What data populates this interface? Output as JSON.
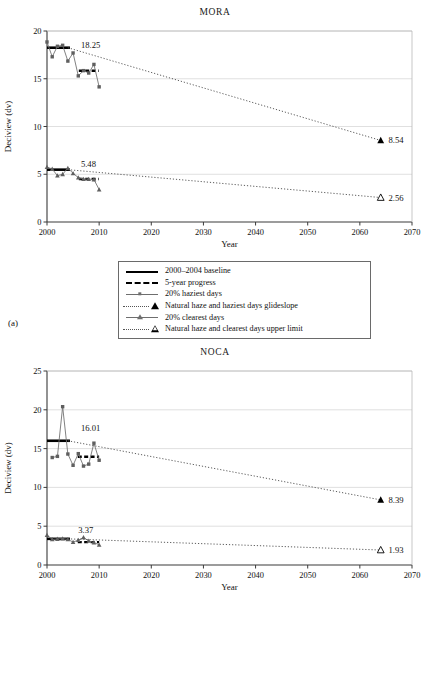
{
  "figure": {
    "axis_label_y": "Deciview (dv)",
    "axis_label_x": "Year",
    "panel_a_label": "(a)",
    "panel_b_label": "(b)"
  },
  "legend": {
    "items": [
      {
        "key": "solid-line",
        "label": "2000–2004 baseline"
      },
      {
        "key": "dashed-line",
        "label": "5-year progress"
      },
      {
        "key": "square-marker-line",
        "label": "20% haziest days"
      },
      {
        "key": "dotted-filled-triangle",
        "label": "Natural haze and haziest days glideslope"
      },
      {
        "key": "triangle-marker-line",
        "label": "20% clearest days"
      },
      {
        "key": "dotted-open-triangle",
        "label": "Natural haze and clearest days upper limit"
      }
    ]
  },
  "chart_data": [
    {
      "type": "line",
      "title": "MORA",
      "panel": "(a)",
      "xlabel": "Year",
      "ylabel": "Deciview (dv)",
      "xlim": [
        2000,
        2070
      ],
      "ylim": [
        0,
        20
      ],
      "xticks": [
        2000,
        2010,
        2020,
        2030,
        2040,
        2050,
        2060,
        2070
      ],
      "yticks": [
        0,
        5,
        10,
        15,
        20
      ],
      "grid": "horizontal",
      "legend_position": "below-plot",
      "annotations": [
        {
          "text": "18.25",
          "x": 2006.5,
          "y": 18.5
        },
        {
          "text": "5.48",
          "x": 2006.5,
          "y": 6.1
        },
        {
          "text": "8.54",
          "x": 2065.5,
          "y": 8.54
        },
        {
          "text": "2.56",
          "x": 2065.5,
          "y": 2.56
        }
      ],
      "series": [
        {
          "name": "2000-2004 baseline (haziest)",
          "style": "solid-bar",
          "value": 18.25,
          "x_start": 2000,
          "x_end": 2004.4
        },
        {
          "name": "5-year progress (haziest)",
          "style": "dashed-bar",
          "value": 15.83,
          "x_start": 2006.1,
          "x_end": 2009.9
        },
        {
          "name": "20% haziest days",
          "style": "line-square",
          "x": [
            2000,
            2001,
            2002,
            2003,
            2004,
            2005,
            2006,
            2007,
            2008,
            2009,
            2010
          ],
          "values": [
            18.85,
            17.3,
            18.4,
            18.5,
            16.85,
            17.7,
            15.3,
            15.85,
            15.6,
            16.5,
            14.15
          ]
        },
        {
          "name": "Natural haze and haziest days glideslope",
          "style": "dotted",
          "x": [
            2004,
            2064
          ],
          "values": [
            18.25,
            8.54
          ],
          "end_marker": "filled-triangle",
          "end_value": 8.54
        },
        {
          "name": "2000-2004 baseline (clearest)",
          "style": "solid-bar",
          "value": 5.48,
          "x_start": 2000,
          "x_end": 2004.4
        },
        {
          "name": "5-year progress (clearest)",
          "style": "dashed-bar",
          "value": 4.5,
          "x_start": 2006.1,
          "x_end": 2009.9
        },
        {
          "name": "20% clearest days",
          "style": "line-triangle",
          "x": [
            2000,
            2001,
            2002,
            2003,
            2004,
            2005,
            2006,
            2007,
            2008,
            2009,
            2010
          ],
          "values": [
            5.75,
            5.55,
            4.85,
            5.0,
            5.65,
            5.1,
            4.65,
            4.5,
            4.5,
            4.45,
            3.4
          ]
        },
        {
          "name": "Natural haze and clearest days upper limit",
          "style": "dotted",
          "x": [
            2004,
            2064
          ],
          "values": [
            5.48,
            2.56
          ],
          "end_marker": "open-triangle",
          "end_value": 2.56
        }
      ]
    },
    {
      "type": "line",
      "title": "NOCA",
      "panel": "(b)",
      "xlabel": "Year",
      "ylabel": "Deciview (dv)",
      "xlim": [
        2000,
        2070
      ],
      "ylim": [
        0,
        25
      ],
      "xticks": [
        2000,
        2010,
        2020,
        2030,
        2040,
        2050,
        2060,
        2070
      ],
      "yticks": [
        0,
        5,
        10,
        15,
        20,
        25
      ],
      "grid": "horizontal",
      "legend_position": "below-plot",
      "annotations": [
        {
          "text": "16.01",
          "x": 2006.5,
          "y": 17.6
        },
        {
          "text": "3.37",
          "x": 2006.0,
          "y": 4.5
        },
        {
          "text": "8.39",
          "x": 2065.5,
          "y": 8.39
        },
        {
          "text": "1.93",
          "x": 2065.5,
          "y": 1.93
        }
      ],
      "series": [
        {
          "name": "2000-2004 baseline (haziest)",
          "style": "solid-bar",
          "value": 16.01,
          "x_start": 2000,
          "x_end": 2004.4
        },
        {
          "name": "5-year progress (haziest)",
          "style": "dashed-bar",
          "value": 13.95,
          "x_start": 2005.9,
          "x_end": 2010.0
        },
        {
          "name": "20% haziest days",
          "style": "line-square",
          "x": [
            2001,
            2002,
            2003,
            2004,
            2005,
            2006,
            2007,
            2008,
            2009,
            2010
          ],
          "values": [
            13.85,
            14.0,
            20.4,
            14.3,
            12.85,
            14.35,
            12.75,
            13.0,
            15.7,
            13.5
          ]
        },
        {
          "name": "Natural haze and haziest days glideslope",
          "style": "dotted",
          "x": [
            2004,
            2064
          ],
          "values": [
            16.01,
            8.39
          ],
          "end_marker": "filled-triangle",
          "end_value": 8.39
        },
        {
          "name": "2000-2004 baseline (clearest)",
          "style": "solid-bar",
          "value": 3.37,
          "x_start": 2000,
          "x_end": 2004.4
        },
        {
          "name": "5-year progress (clearest)",
          "style": "dashed-bar",
          "value": 2.95,
          "x_start": 2005.9,
          "x_end": 2010.0
        },
        {
          "name": "20% clearest days",
          "style": "line-triangle",
          "x": [
            2000,
            2001,
            2002,
            2003,
            2004,
            2005,
            2006,
            2007,
            2008,
            2009,
            2010
          ],
          "values": [
            3.85,
            3.3,
            3.35,
            3.4,
            3.3,
            2.95,
            3.2,
            3.55,
            3.1,
            2.9,
            2.6
          ]
        },
        {
          "name": "Natural haze and clearest days upper limit",
          "style": "dotted",
          "x": [
            2004,
            2064
          ],
          "values": [
            3.37,
            1.93
          ],
          "end_marker": "open-triangle",
          "end_value": 1.93
        }
      ]
    }
  ]
}
